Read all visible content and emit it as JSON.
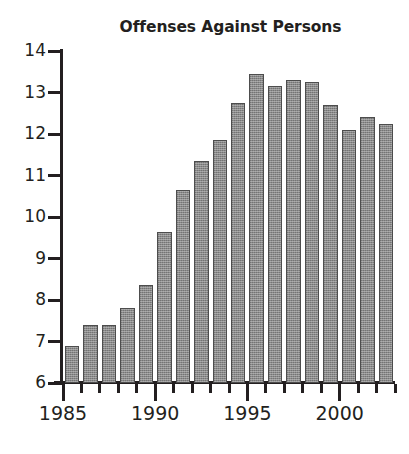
{
  "chart_data": {
    "type": "bar",
    "title": "Offenses Against Persons",
    "xlabel": "",
    "ylabel": "",
    "ylim": [
      6,
      14
    ],
    "xlim": [
      1984.5,
      2002.5
    ],
    "grid": false,
    "legend": false,
    "y_ticks": [
      14,
      13,
      12,
      11,
      10,
      9,
      8,
      7,
      6
    ],
    "y_tick_labels": [
      "14",
      "13",
      "12",
      "11",
      "10",
      "9",
      "8",
      "7",
      "6"
    ],
    "x_tick_labels": [
      "1985",
      "1990",
      "1995",
      "2000"
    ],
    "x_tick_values": [
      1985,
      1990,
      1995,
      2000
    ],
    "categories": [
      1985,
      1986,
      1987,
      1988,
      1989,
      1990,
      1991,
      1992,
      1993,
      1994,
      1995,
      1996,
      1997,
      1998,
      1999,
      2000,
      2001,
      2002
    ],
    "values": [
      6.9,
      7.4,
      7.4,
      7.8,
      8.35,
      9.65,
      10.65,
      11.35,
      11.85,
      12.75,
      13.45,
      13.15,
      13.3,
      13.25,
      12.7,
      12.1,
      12.4,
      12.25
    ],
    "bar_color": "#8a8a8a",
    "bar_edge_color": "#4d4d4d",
    "background_color": "#ffffff",
    "text_color": "#231f20"
  }
}
